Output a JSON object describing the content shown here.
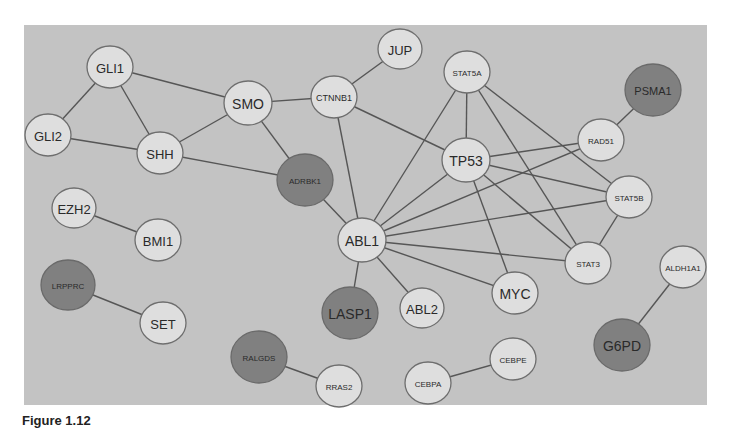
{
  "figure": {
    "caption": "Figure 1.12",
    "background_color": "#c3c3c3",
    "node_colors": {
      "light": "#dedede",
      "dark": "#808080"
    }
  },
  "nodes": [
    {
      "id": "GLI1",
      "label": "GLI1",
      "x": 110,
      "y": 67,
      "r": 22,
      "fs": 13,
      "shade": "light"
    },
    {
      "id": "GLI2",
      "label": "GLI2",
      "x": 48,
      "y": 135,
      "r": 22,
      "fs": 13,
      "shade": "light"
    },
    {
      "id": "SHH",
      "label": "SHH",
      "x": 160,
      "y": 153,
      "r": 22,
      "fs": 13,
      "shade": "light"
    },
    {
      "id": "SMO",
      "label": "SMO",
      "x": 248,
      "y": 103,
      "r": 23,
      "fs": 14,
      "shade": "light"
    },
    {
      "id": "CTNNB1",
      "label": "CTNNB1",
      "x": 334,
      "y": 97,
      "r": 22,
      "fs": 9,
      "shade": "light"
    },
    {
      "id": "JUP",
      "label": "JUP",
      "x": 400,
      "y": 49,
      "r": 21,
      "fs": 13,
      "shade": "light"
    },
    {
      "id": "ADRBK1",
      "label": "ADRBK1",
      "x": 305,
      "y": 180,
      "r": 27,
      "fs": 8,
      "shade": "dark"
    },
    {
      "id": "EZH2",
      "label": "EZH2",
      "x": 74,
      "y": 208,
      "r": 21,
      "fs": 13,
      "shade": "light"
    },
    {
      "id": "BMI1",
      "label": "BMI1",
      "x": 158,
      "y": 240,
      "r": 22,
      "fs": 13,
      "shade": "light"
    },
    {
      "id": "LRPPRC",
      "label": "LRPPRC",
      "x": 68,
      "y": 285,
      "r": 26,
      "fs": 8,
      "shade": "dark"
    },
    {
      "id": "SET",
      "label": "SET",
      "x": 163,
      "y": 323,
      "r": 22,
      "fs": 13,
      "shade": "light"
    },
    {
      "id": "ABL1",
      "label": "ABL1",
      "x": 362,
      "y": 240,
      "r": 23,
      "fs": 14,
      "shade": "light"
    },
    {
      "id": "LASP1",
      "label": "LASP1",
      "x": 350,
      "y": 313,
      "r": 27,
      "fs": 14,
      "shade": "dark"
    },
    {
      "id": "ABL2",
      "label": "ABL2",
      "x": 422,
      "y": 308,
      "r": 21,
      "fs": 13,
      "shade": "light"
    },
    {
      "id": "MYC",
      "label": "MYC",
      "x": 515,
      "y": 293,
      "r": 22,
      "fs": 14,
      "shade": "light"
    },
    {
      "id": "STAT5A",
      "label": "STAT5A",
      "x": 467,
      "y": 72,
      "r": 22,
      "fs": 8,
      "shade": "light"
    },
    {
      "id": "TP53",
      "label": "TP53",
      "x": 466,
      "y": 160,
      "r": 23,
      "fs": 14,
      "shade": "light"
    },
    {
      "id": "RAD51",
      "label": "RAD51",
      "x": 601,
      "y": 140,
      "r": 22,
      "fs": 8,
      "shade": "light"
    },
    {
      "id": "PSMA1",
      "label": "PSMA1",
      "x": 653,
      "y": 90,
      "r": 27,
      "fs": 11,
      "shade": "dark"
    },
    {
      "id": "STAT5B",
      "label": "STAT5B",
      "x": 629,
      "y": 197,
      "r": 22,
      "fs": 8,
      "shade": "light"
    },
    {
      "id": "STAT3",
      "label": "STAT3",
      "x": 588,
      "y": 263,
      "r": 22,
      "fs": 8,
      "shade": "light"
    },
    {
      "id": "ALDH1A1",
      "label": "ALDH1A1",
      "x": 683,
      "y": 267,
      "r": 22,
      "fs": 8,
      "shade": "light"
    },
    {
      "id": "G6PD",
      "label": "G6PD",
      "x": 622,
      "y": 345,
      "r": 27,
      "fs": 14,
      "shade": "dark"
    },
    {
      "id": "RALGDS",
      "label": "RALGDS",
      "x": 259,
      "y": 357,
      "r": 27,
      "fs": 8,
      "shade": "dark"
    },
    {
      "id": "RRAS2",
      "label": "RRAS2",
      "x": 339,
      "y": 386,
      "r": 22,
      "fs": 8,
      "shade": "light"
    },
    {
      "id": "CEBPA",
      "label": "CEBPA",
      "x": 428,
      "y": 383,
      "r": 22,
      "fs": 8,
      "shade": "light"
    },
    {
      "id": "CEBPE",
      "label": "CEBPE",
      "x": 513,
      "y": 359,
      "r": 22,
      "fs": 8,
      "shade": "light"
    }
  ],
  "edges": [
    [
      "GLI1",
      "GLI2"
    ],
    [
      "GLI1",
      "SHH"
    ],
    [
      "GLI1",
      "SMO"
    ],
    [
      "GLI2",
      "SHH"
    ],
    [
      "SHH",
      "SMO"
    ],
    [
      "SHH",
      "ADRBK1"
    ],
    [
      "SMO",
      "CTNNB1"
    ],
    [
      "SMO",
      "ADRBK1"
    ],
    [
      "CTNNB1",
      "JUP"
    ],
    [
      "CTNNB1",
      "TP53"
    ],
    [
      "CTNNB1",
      "ABL1"
    ],
    [
      "ADRBK1",
      "ABL1"
    ],
    [
      "ABL1",
      "STAT5A"
    ],
    [
      "ABL1",
      "TP53"
    ],
    [
      "ABL1",
      "RAD51"
    ],
    [
      "ABL1",
      "STAT5B"
    ],
    [
      "ABL1",
      "STAT3"
    ],
    [
      "ABL1",
      "MYC"
    ],
    [
      "ABL1",
      "ABL2"
    ],
    [
      "ABL1",
      "LASP1"
    ],
    [
      "STAT5A",
      "TP53"
    ],
    [
      "STAT5A",
      "STAT3"
    ],
    [
      "STAT5A",
      "STAT5B"
    ],
    [
      "TP53",
      "RAD51"
    ],
    [
      "TP53",
      "STAT5B"
    ],
    [
      "TP53",
      "STAT3"
    ],
    [
      "TP53",
      "MYC"
    ],
    [
      "RAD51",
      "PSMA1"
    ],
    [
      "STAT5B",
      "STAT3"
    ],
    [
      "EZH2",
      "BMI1"
    ],
    [
      "LRPPRC",
      "SET"
    ],
    [
      "RALGDS",
      "RRAS2"
    ],
    [
      "CEBPA",
      "CEBPE"
    ],
    [
      "ALDH1A1",
      "G6PD"
    ]
  ]
}
